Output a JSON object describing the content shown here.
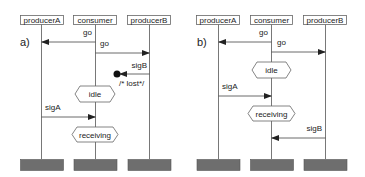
{
  "diagrams": [
    {
      "label": "a)",
      "lifelines": [
        "producerA",
        "consumer",
        "producerB"
      ],
      "messages": [
        {
          "label": "go",
          "from": "consumer",
          "to": "producerA"
        },
        {
          "label": "go",
          "from": "consumer",
          "to": "producerB"
        },
        {
          "label": "sigB",
          "from": "producerB",
          "to": "lost",
          "note": "/* lost*/"
        },
        {
          "label": "sigA",
          "from": "producerA",
          "to": "consumer"
        }
      ],
      "states": [
        "idle",
        "receiving"
      ]
    },
    {
      "label": "b)",
      "lifelines": [
        "producerA",
        "consumer",
        "producerB"
      ],
      "messages": [
        {
          "label": "go",
          "from": "consumer",
          "to": "producerA"
        },
        {
          "label": "go",
          "from": "consumer",
          "to": "producerB"
        },
        {
          "label": "sigA",
          "from": "producerA",
          "to": "consumer"
        },
        {
          "label": "sigB",
          "from": "producerB",
          "to": "consumer"
        }
      ],
      "states": [
        "idle",
        "receiving"
      ]
    }
  ]
}
